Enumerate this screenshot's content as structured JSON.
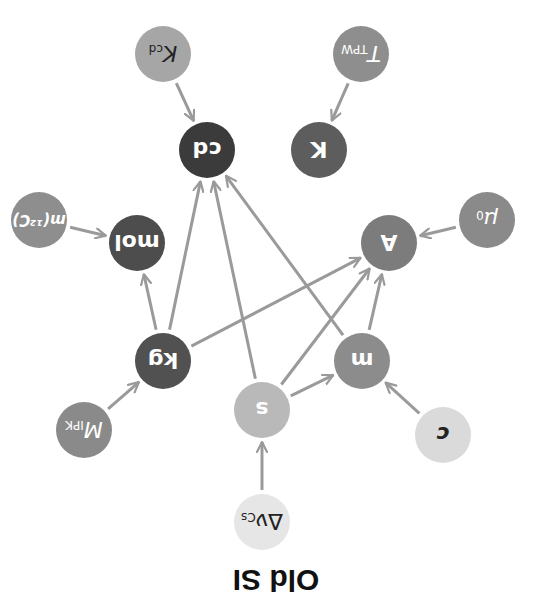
{
  "title": "Old SI",
  "orientation": "rotated-180",
  "colors": {
    "edge": "#9a9a9a",
    "background": "#ffffff",
    "title": "#111111"
  },
  "nodes": [
    {
      "id": "K_cd",
      "label": "K",
      "sub": "cd",
      "x": 163,
      "y": 54,
      "fill": "#a6a6a6",
      "text": "#222222",
      "italic": true
    },
    {
      "id": "cd",
      "label": "cd",
      "sub": "",
      "x": 207,
      "y": 150,
      "fill": "#3b3b3b",
      "text": "#ffffff",
      "italic": false
    },
    {
      "id": "T_pw",
      "label": "T",
      "sub": "TPW",
      "x": 361,
      "y": 54,
      "fill": "#8e8e8e",
      "text": "#ffffff",
      "italic": true
    },
    {
      "id": "K",
      "label": "K",
      "sub": "",
      "x": 319,
      "y": 150,
      "fill": "#5d5d5d",
      "text": "#ffffff",
      "italic": false
    },
    {
      "id": "m12C",
      "label": "m(¹²C)",
      "sub": "",
      "x": 39,
      "y": 220,
      "fill": "#8e8e8e",
      "text": "#ffffff",
      "italic": true
    },
    {
      "id": "mol",
      "label": "mol",
      "sub": "",
      "x": 137,
      "y": 243,
      "fill": "#4d4d4d",
      "text": "#ffffff",
      "italic": false
    },
    {
      "id": "mu0",
      "label": "μ",
      "sub": "0",
      "x": 487,
      "y": 220,
      "fill": "#8a8a8a",
      "text": "#ffffff",
      "italic": true
    },
    {
      "id": "A",
      "label": "A",
      "sub": "",
      "x": 389,
      "y": 243,
      "fill": "#7c7c7c",
      "text": "#ffffff",
      "italic": false
    },
    {
      "id": "kg",
      "label": "kg",
      "sub": "",
      "x": 163,
      "y": 361,
      "fill": "#515151",
      "text": "#ffffff",
      "italic": false
    },
    {
      "id": "M_IPK",
      "label": "M",
      "sub": "IPK",
      "x": 84,
      "y": 430,
      "fill": "#8a8a8a",
      "text": "#ffffff",
      "italic": true
    },
    {
      "id": "s",
      "label": "s",
      "sub": "",
      "x": 262,
      "y": 410,
      "fill": "#b9b9b9",
      "text": "#ffffff",
      "italic": false
    },
    {
      "id": "m",
      "label": "m",
      "sub": "",
      "x": 362,
      "y": 361,
      "fill": "#8c8c8c",
      "text": "#ffffff",
      "italic": false
    },
    {
      "id": "c",
      "label": "c",
      "sub": "",
      "x": 443,
      "y": 435,
      "fill": "#dadada",
      "text": "#222222",
      "italic": true
    },
    {
      "id": "dnu_Cs",
      "label": "Δν",
      "sub": "Cs",
      "x": 262,
      "y": 522,
      "fill": "#e6e6e6",
      "text": "#222222",
      "italic": false
    }
  ],
  "edges": [
    {
      "from": "K_cd",
      "to": "cd"
    },
    {
      "from": "T_pw",
      "to": "K"
    },
    {
      "from": "m12C",
      "to": "mol"
    },
    {
      "from": "mu0",
      "to": "A"
    },
    {
      "from": "kg",
      "to": "mol"
    },
    {
      "from": "kg",
      "to": "cd"
    },
    {
      "from": "kg",
      "to": "A"
    },
    {
      "from": "s",
      "to": "cd"
    },
    {
      "from": "s",
      "to": "A"
    },
    {
      "from": "s",
      "to": "m"
    },
    {
      "from": "m",
      "to": "cd"
    },
    {
      "from": "m",
      "to": "A"
    },
    {
      "from": "M_IPK",
      "to": "kg"
    },
    {
      "from": "c",
      "to": "m"
    },
    {
      "from": "dnu_Cs",
      "to": "s"
    }
  ],
  "node_radius": 28,
  "title_pos": {
    "x": 276,
    "y": 580
  }
}
